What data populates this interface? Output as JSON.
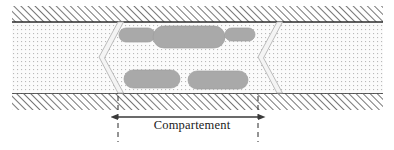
{
  "figure": {
    "type": "cross-section-diagram",
    "title_text": "",
    "canvas": {
      "width": 394,
      "height": 150
    },
    "colors": {
      "wall_hatch_line": "#4a4a4a",
      "wall_background": "#ffffff",
      "channel_fill": "#fbfbfb",
      "channel_stipple": "#b9b9b9",
      "channel_border": "#2b2b2b",
      "particle_fill": "#a9a9a9",
      "particle_edge": "#9a9a9a",
      "baffle_fill": "#f4f4f4",
      "baffle_edge": "#b4b4b4",
      "dimension_line": "#3a3a3a",
      "extension_line": "#2b2b2b",
      "label_text": "#1a1a1a"
    },
    "channel": {
      "name": "channel-duct",
      "x": 12,
      "y": 22,
      "width": 371,
      "height": 72
    },
    "top_wall": {
      "name": "top-wall",
      "x": 12,
      "y": 6,
      "width": 371,
      "height": 16,
      "hatch_direction": "forward-slash",
      "hatch_spacing": 5
    },
    "bottom_wall": {
      "name": "bottom-wall",
      "x": 12,
      "y": 94,
      "width": 371,
      "height": 16,
      "hatch_direction": "forward-slash",
      "hatch_spacing": 5
    },
    "baffles": [
      {
        "name": "baffle-left",
        "orientation": "chevron-pointing-left",
        "top_x": 118,
        "bottom_x": 118,
        "apex_x": 99,
        "apex_y": 58,
        "thickness": 5
      },
      {
        "name": "baffle-right",
        "orientation": "chevron-pointing-left",
        "top_x": 277,
        "bottom_x": 277,
        "apex_x": 258,
        "apex_y": 58,
        "thickness": 5
      }
    ],
    "particles": [
      {
        "name": "particle-top-left",
        "cx": 137,
        "cy": 35,
        "rx": 18,
        "ry": 7
      },
      {
        "name": "particle-top-center",
        "cx": 189,
        "cy": 37,
        "rx": 36,
        "ry": 11
      },
      {
        "name": "particle-top-right",
        "cx": 240,
        "cy": 34,
        "rx": 15,
        "ry": 6
      },
      {
        "name": "particle-bottom-left",
        "cx": 152,
        "cy": 79,
        "rx": 28,
        "ry": 9
      },
      {
        "name": "particle-bottom-right",
        "cx": 218,
        "cy": 80,
        "rx": 30,
        "ry": 9
      }
    ],
    "dimension": {
      "name": "compartment-dimension",
      "label": "Compartement",
      "line_y": 117,
      "start_x": 118,
      "end_x": 258,
      "extension_top_y": 96,
      "extension_bottom_y": 142,
      "arrowheads": "both-ends",
      "extension_style": "dashed"
    }
  }
}
